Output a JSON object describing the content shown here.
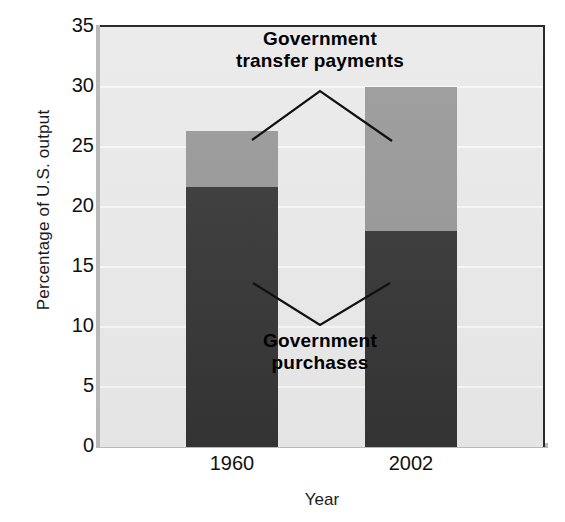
{
  "chart_data": {
    "type": "bar",
    "stacked": true,
    "title": "",
    "xlabel": "Year",
    "ylabel": "Percentage of U.S. output",
    "categories": [
      "1960",
      "2002"
    ],
    "ylim": [
      0,
      35
    ],
    "yticks": [
      0,
      5,
      10,
      15,
      20,
      25,
      30,
      35
    ],
    "ytick_labels": [
      "0",
      "5",
      "10",
      "15",
      "20",
      "25",
      "30",
      "35"
    ],
    "grid": true,
    "legend": "annotations",
    "series": [
      {
        "name": "Government purchases",
        "color": "#343434",
        "values": [
          21.7,
          18.0
        ]
      },
      {
        "name": "Government transfer payments",
        "color": "#969696",
        "values": [
          4.6,
          12.0
        ]
      }
    ],
    "totals": [
      26.3,
      30.0
    ],
    "annotations": [
      {
        "id": "transfers",
        "line1": "Government",
        "line2": "transfer payments"
      },
      {
        "id": "purchases",
        "line1": "Government",
        "line2": "purchases"
      }
    ]
  },
  "colors": {
    "purchases": "#343434",
    "transfers": "#969696",
    "plot_background": "#e9e9e9",
    "gridline": "#f7f7f7",
    "axis": "#2b2b2b",
    "text": "#111111"
  }
}
